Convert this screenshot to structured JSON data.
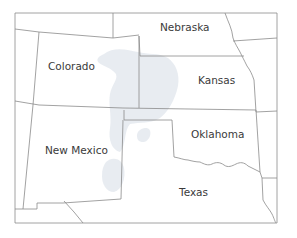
{
  "map": {
    "type": "regional state map",
    "states": [
      {
        "name": "Nebraska",
        "x": 160,
        "y": 28
      },
      {
        "name": "Colorado",
        "x": 48,
        "y": 67
      },
      {
        "name": "Kansas",
        "x": 198,
        "y": 81
      },
      {
        "name": "Oklahoma",
        "x": 191,
        "y": 135
      },
      {
        "name": "New Mexico",
        "x": 45,
        "y": 151
      },
      {
        "name": "Texas",
        "x": 179,
        "y": 193
      }
    ],
    "highlight": {
      "description": "light blue-gray shaded region spanning eastern Colorado, western Kansas, Oklahoma panhandle and eastern New Mexico",
      "color": "#e4e9ee"
    },
    "colors": {
      "background": "#ffffff",
      "border": "#8a8a8a",
      "label": "#3a3a3a"
    }
  }
}
